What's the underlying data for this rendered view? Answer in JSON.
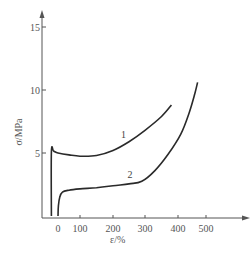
{
  "chart_data": {
    "type": "line",
    "title": "",
    "xlabel": "ε/%",
    "ylabel": "σ/MPa",
    "xlim": [
      -50,
      590
    ],
    "ylim": [
      0,
      16
    ],
    "x_ticks": [
      0,
      100,
      200,
      300,
      400,
      500
    ],
    "x_tick_labels": [
      "0",
      "100",
      "200",
      "300",
      "400",
      "500"
    ],
    "y_ticks": [
      5,
      10,
      15
    ],
    "y_tick_labels": [
      "5",
      "10",
      "15"
    ],
    "grid": false,
    "legend": null,
    "series": [
      {
        "name": "1",
        "label_position": {
          "x": 225,
          "y": 6.2
        },
        "points": [
          [
            -30,
            0
          ],
          [
            -30,
            5.1
          ],
          [
            -20,
            5.15
          ],
          [
            0,
            5.0
          ],
          [
            50,
            4.85
          ],
          [
            100,
            4.75
          ],
          [
            150,
            4.8
          ],
          [
            200,
            5.2
          ],
          [
            250,
            5.9
          ],
          [
            300,
            6.8
          ],
          [
            350,
            7.9
          ],
          [
            380,
            8.8
          ]
        ]
      },
      {
        "name": "2",
        "label_position": {
          "x": 245,
          "y": 3.0
        },
        "points": [
          [
            0,
            0
          ],
          [
            2,
            0.8
          ],
          [
            8,
            1.5
          ],
          [
            20,
            1.9
          ],
          [
            50,
            2.05
          ],
          [
            100,
            2.15
          ],
          [
            150,
            2.25
          ],
          [
            200,
            2.4
          ],
          [
            250,
            2.55
          ],
          [
            290,
            2.75
          ],
          [
            330,
            3.6
          ],
          [
            370,
            4.9
          ],
          [
            410,
            6.5
          ],
          [
            440,
            8.2
          ],
          [
            460,
            9.7
          ],
          [
            470,
            10.6
          ]
        ]
      }
    ]
  },
  "axes": {
    "xlabel": "ε/%",
    "ylabel": "σ/MPa",
    "x_tick_labels": [
      "0",
      "100",
      "200",
      "300",
      "400",
      "500"
    ],
    "y_tick_labels": [
      "5",
      "10",
      "15"
    ]
  },
  "curve_labels": [
    "1",
    "2"
  ]
}
